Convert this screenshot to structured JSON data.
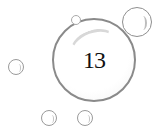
{
  "badge": {
    "number": "13"
  },
  "colors": {
    "outline": "#8a8a8a",
    "text": "#111111",
    "background": "#ffffff"
  }
}
